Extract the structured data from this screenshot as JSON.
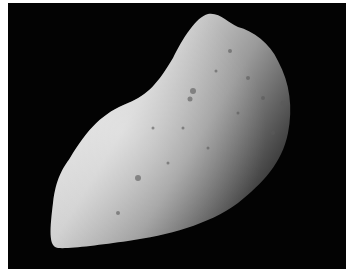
{
  "image": {
    "subject": "asteroid",
    "description": "Grayscale photograph of a cratered, elongated asteroid against black space",
    "colors": {
      "background": "#030303",
      "border": "#ffffff",
      "surface_light": "#d8d8d8",
      "surface_mid": "#9a9a9a",
      "surface_dark": "#3a3a3a"
    }
  }
}
